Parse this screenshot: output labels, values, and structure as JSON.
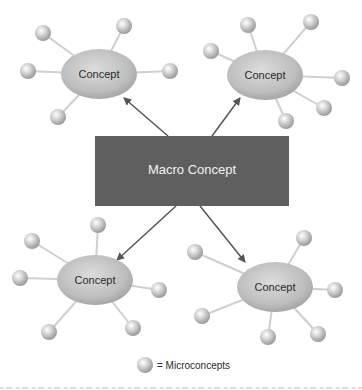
{
  "diagram": {
    "macro_concept": {
      "label": "Macro Concept",
      "x": 95,
      "y": 136,
      "w": 194,
      "h": 70,
      "color": "#5f5f5f"
    },
    "concepts": [
      {
        "id": "top-left",
        "label": "Concept",
        "cx": 99,
        "cy": 74,
        "rx": 38,
        "ry": 25,
        "microconcepts": [
          [
            43,
            33
          ],
          [
            124,
            26
          ],
          [
            28,
            71
          ],
          [
            170,
            71
          ],
          [
            58,
            117
          ]
        ],
        "arrow_from": [
          168,
          136
        ],
        "arrow_to": [
          124,
          98
        ]
      },
      {
        "id": "top-right",
        "label": "Concept",
        "cx": 265,
        "cy": 75,
        "rx": 38,
        "ry": 25,
        "microconcepts": [
          [
            248,
            25
          ],
          [
            311,
            22
          ],
          [
            211,
            51
          ],
          [
            342,
            78
          ],
          [
            324,
            108
          ],
          [
            286,
            121
          ]
        ],
        "arrow_from": [
          212,
          136
        ],
        "arrow_to": [
          240,
          98
        ]
      },
      {
        "id": "bottom-left",
        "label": "Concept",
        "cx": 95,
        "cy": 280,
        "rx": 38,
        "ry": 25,
        "microconcepts": [
          [
            98,
            225
          ],
          [
            32,
            241
          ],
          [
            20,
            278
          ],
          [
            159,
            290
          ],
          [
            133,
            328
          ],
          [
            49,
            332
          ]
        ],
        "arrow_from": [
          176,
          206
        ],
        "arrow_to": [
          117,
          260
        ]
      },
      {
        "id": "bottom-right",
        "label": "Concept",
        "cx": 275,
        "cy": 287,
        "rx": 38,
        "ry": 25,
        "microconcepts": [
          [
            304,
            238
          ],
          [
            195,
            252
          ],
          [
            335,
            290
          ],
          [
            202,
            316
          ],
          [
            318,
            334
          ],
          [
            268,
            337
          ]
        ],
        "arrow_from": [
          200,
          206
        ],
        "arrow_to": [
          245,
          262
        ]
      }
    ]
  },
  "legend": {
    "label": "= Microconcepts",
    "icon": "sphere-icon"
  }
}
